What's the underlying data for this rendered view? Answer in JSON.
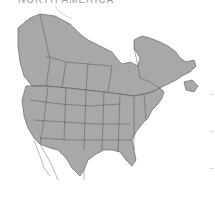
{
  "title": "NORTH AMERICA",
  "map": {
    "region": "North America (Canada, United States)",
    "land_color": "#a8a8a8",
    "border_color": "#555555",
    "background": "#ffffff"
  },
  "ticks": [
    94,
    131,
    168
  ]
}
